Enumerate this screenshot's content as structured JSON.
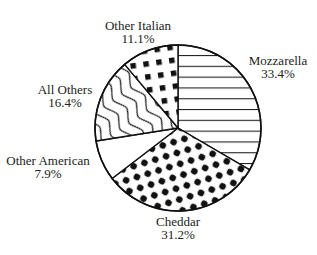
{
  "chart_data": {
    "type": "pie",
    "title": "",
    "categories": [
      "Mozzarella",
      "Cheddar",
      "Other American",
      "All Others",
      "Other Italian"
    ],
    "values": [
      33.4,
      31.2,
      7.9,
      16.4,
      11.1
    ],
    "value_labels": [
      "33.4%",
      "31.2%",
      "7.9%",
      "16.4%",
      "11.1%"
    ],
    "patterns": [
      "horizontal-lines",
      "dots",
      "none",
      "wavy-lines",
      "squares"
    ],
    "start_angle_deg": -90,
    "direction": "clockwise",
    "legend": "none (direct labels)",
    "colors": {
      "stroke": "#111111",
      "fill": "#ffffff",
      "text": "#222222"
    }
  },
  "labels": [
    {
      "name": "Mozzarella",
      "pct": "33.4%"
    },
    {
      "name": "Cheddar",
      "pct": "31.2%"
    },
    {
      "name": "Other American",
      "pct": "7.9%"
    },
    {
      "name": "All Others",
      "pct": "16.4%"
    },
    {
      "name": "Other Italian",
      "pct": "11.1%"
    }
  ]
}
